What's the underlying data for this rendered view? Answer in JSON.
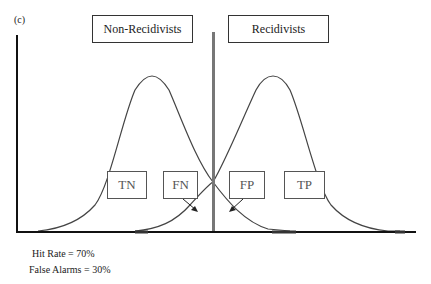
{
  "panel_label": "(c)",
  "groups": [
    {
      "label": "Non-Recidivists"
    },
    {
      "label": "Recidivists"
    }
  ],
  "cells": [
    {
      "label": "TN"
    },
    {
      "label": "FN"
    },
    {
      "label": "FP"
    },
    {
      "label": "TP"
    }
  ],
  "stats": {
    "hit_rate": "Hit Rate = 70%",
    "false_alarms": "False Alarms = 30%"
  },
  "colors": {
    "axis": "#111111",
    "curve": "#444444",
    "criterion": "#777777",
    "box_border": "#333333"
  }
}
